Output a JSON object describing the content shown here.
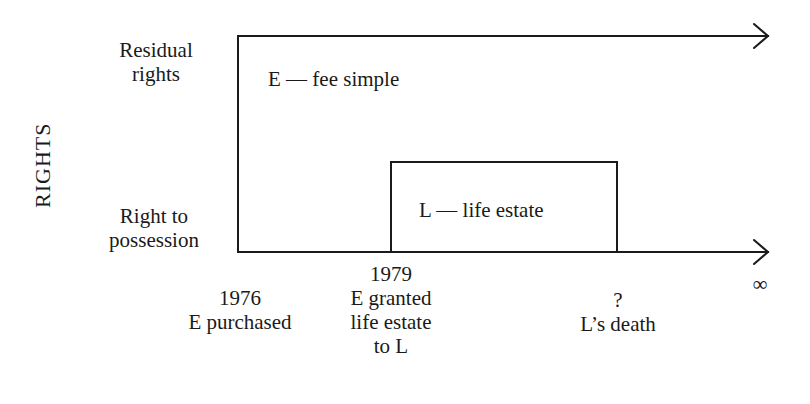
{
  "diagram": {
    "axis_title": "RIGHTS",
    "rows": [
      {
        "line1": "Residual",
        "line2": "rights"
      },
      {
        "line1": "Right to",
        "line2": "possession"
      }
    ],
    "regions": {
      "fee_simple": "E — fee simple",
      "life_estate": "L — life estate"
    },
    "timeline": [
      {
        "year": "1976",
        "lines": [
          "E purchased"
        ]
      },
      {
        "year": "1979",
        "lines": [
          "E granted",
          "life estate",
          "to L"
        ]
      },
      {
        "year": "?",
        "lines": [
          "L’s death"
        ]
      },
      {
        "year": "∞",
        "lines": []
      }
    ],
    "colors": {
      "line": "#1a1a1a",
      "background": "#ffffff"
    }
  }
}
